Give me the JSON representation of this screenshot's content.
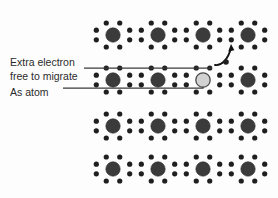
{
  "figure": {
    "background_color": "#fdfdfd"
  },
  "annotations": {
    "extra_electron": {
      "line1": "Extra electron",
      "line2": "free to migrate",
      "name": "extra-electron-label"
    },
    "as_atom": {
      "line1": "As atom",
      "name": "as-atom-label"
    }
  },
  "colors": {
    "host_atom_fill": "#3b3b3b",
    "host_atom_stroke": "#2a2a2a",
    "dopant_atom_fill": "#d2d2d2",
    "dopant_atom_stroke": "#4a4a4a",
    "free_electron_fill": "#1f1f1f",
    "electron_dot_fill": "#1f1f1f",
    "leader_line": "#3a3a3a",
    "arrow": "#111111",
    "text": "#2b2b2b"
  },
  "lattice": {
    "rows": 4,
    "columns": 4,
    "atom_radius": 7.2,
    "electron_dot_radius": 2.6,
    "column_x": [
      113,
      158,
      203,
      248
    ],
    "row_y": [
      35,
      80,
      126,
      169
    ],
    "ring_offset": 18,
    "dopant_position": {
      "row": 1,
      "column": 2
    },
    "atoms": [
      {
        "row": 0,
        "col": 0,
        "cx": 113,
        "cy": 35,
        "type": "host"
      },
      {
        "row": 0,
        "col": 1,
        "cx": 158,
        "cy": 35,
        "type": "host"
      },
      {
        "row": 0,
        "col": 2,
        "cx": 203,
        "cy": 35,
        "type": "host"
      },
      {
        "row": 0,
        "col": 3,
        "cx": 248,
        "cy": 35,
        "type": "host"
      },
      {
        "row": 1,
        "col": 0,
        "cx": 113,
        "cy": 80,
        "type": "host"
      },
      {
        "row": 1,
        "col": 1,
        "cx": 158,
        "cy": 80,
        "type": "host"
      },
      {
        "row": 1,
        "col": 2,
        "cx": 203,
        "cy": 80,
        "type": "dopant"
      },
      {
        "row": 1,
        "col": 3,
        "cx": 248,
        "cy": 80,
        "type": "host"
      },
      {
        "row": 2,
        "col": 0,
        "cx": 113,
        "cy": 126,
        "type": "host"
      },
      {
        "row": 2,
        "col": 1,
        "cx": 158,
        "cy": 126,
        "type": "host"
      },
      {
        "row": 2,
        "col": 2,
        "cx": 203,
        "cy": 126,
        "type": "host"
      },
      {
        "row": 2,
        "col": 3,
        "cx": 248,
        "cy": 126,
        "type": "host"
      },
      {
        "row": 3,
        "col": 0,
        "cx": 113,
        "cy": 169,
        "type": "host"
      },
      {
        "row": 3,
        "col": 1,
        "cx": 158,
        "cy": 169,
        "type": "host"
      },
      {
        "row": 3,
        "col": 2,
        "cx": 203,
        "cy": 169,
        "type": "host"
      },
      {
        "row": 3,
        "col": 3,
        "cx": 248,
        "cy": 169,
        "type": "host"
      }
    ]
  },
  "free_electron": {
    "cx": 226,
    "cy": 62,
    "r": 2.8
  },
  "arrow": {
    "path": "M 215 65 C 221 66, 228 60, 231 48",
    "head_points": "231,44 228.2,51.4 234.4,50.2"
  },
  "leaders": {
    "extra_electron_path": "M 84 68 L 212 68",
    "as_atom_path": "M 63 88 L 203 88 L 203 87"
  }
}
